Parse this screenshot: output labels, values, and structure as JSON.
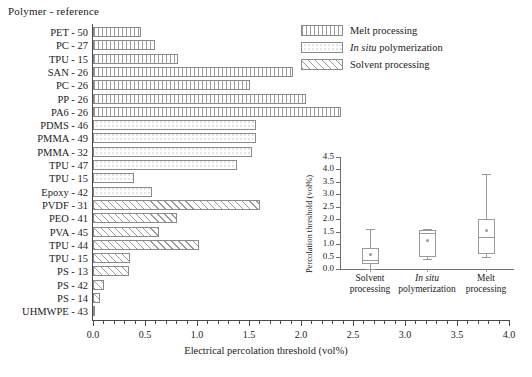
{
  "header": {
    "category_axis_title": "Polymer - reference"
  },
  "legend": {
    "position": "top-right",
    "items": [
      {
        "label": "Melt processing",
        "fill": "vertical-lines",
        "key": "melt"
      },
      {
        "label_italic": "In situ",
        "label_rest": " polymerization",
        "fill": "dotted",
        "key": "insitu"
      },
      {
        "label": "Solvent processing",
        "fill": "diagonal-hatch",
        "key": "solvent"
      }
    ]
  },
  "chart_data": {
    "type": "bar",
    "orientation": "horizontal",
    "title": "",
    "xlabel": "Electrical percolation threshold (vol%)",
    "ylabel": "Polymer - reference",
    "xlim": [
      0.0,
      4.0
    ],
    "xticks": [
      0.0,
      0.5,
      1.0,
      1.5,
      2.0,
      2.5,
      3.0,
      3.5,
      4.0
    ],
    "xticklabels": [
      "0.0",
      "0.5",
      "1.0",
      "1.5",
      "2.0",
      "2.5",
      "3.0",
      "3.5",
      "4.0"
    ],
    "grid": false,
    "categories": [
      "PET - 50",
      "PC - 27",
      "TPU - 15",
      "SAN - 26",
      "PC - 26",
      "PP - 26",
      "PA6 - 26",
      "PDMS - 46",
      "PMMA - 49",
      "PMMA - 32",
      "TPU - 47",
      "TPU - 15",
      "Epoxy - 42",
      "PVDF - 31",
      "PEO - 41",
      "PVA - 45",
      "TPU - 44",
      "TPU - 15",
      "PS - 13",
      "PS - 42",
      "PS - 14",
      "UHMWPE - 43"
    ],
    "values": [
      0.46,
      0.6,
      0.82,
      1.92,
      1.51,
      2.05,
      2.38,
      1.57,
      1.57,
      1.53,
      1.38,
      0.39,
      0.57,
      1.61,
      0.81,
      0.63,
      1.02,
      0.36,
      0.35,
      0.11,
      0.07,
      0.02
    ],
    "groups": [
      "melt",
      "melt",
      "melt",
      "melt",
      "melt",
      "melt",
      "melt",
      "insitu",
      "insitu",
      "insitu",
      "insitu",
      "insitu",
      "insitu",
      "solvent",
      "solvent",
      "solvent",
      "solvent",
      "solvent",
      "solvent",
      "solvent",
      "solvent",
      "solvent"
    ]
  },
  "inset_chart": {
    "type": "box",
    "title": "",
    "ylabel": "Percolation threshold (vol%)",
    "xlabel": "",
    "ylim": [
      0.0,
      4.5
    ],
    "yticks": [
      0.0,
      0.5,
      1.0,
      1.5,
      2.0,
      2.5,
      3.0,
      3.5,
      4.0,
      4.5
    ],
    "yticklabels": [
      "0.0",
      "0.5",
      "1.0",
      "1.5",
      "2.0",
      "2.5",
      "3.0",
      "3.5",
      "4.0",
      "4.5"
    ],
    "grid": false,
    "boxes": [
      {
        "label_line1": "Solvent",
        "label_line2": "processing",
        "italic_line1": false,
        "whisker_low": 0.0,
        "q1": 0.2,
        "median": 0.35,
        "q3": 0.85,
        "whisker_high": 1.6,
        "mean": 0.6
      },
      {
        "label_line1": "In situ",
        "label_line2": "polymerization",
        "italic_line1": true,
        "whisker_low": 0.4,
        "q1": 0.5,
        "median": 1.45,
        "q3": 1.55,
        "whisker_high": 1.6,
        "mean": 1.15
      },
      {
        "label_line1": "Melt",
        "label_line2": "processing",
        "italic_line1": false,
        "whisker_low": 0.5,
        "q1": 0.6,
        "median": 1.3,
        "q3": 2.0,
        "whisker_high": 3.8,
        "mean": 1.55
      }
    ]
  },
  "colors": {
    "axis": "#4a4a4a",
    "bar_border": "#8a8a8a",
    "hatch": "#9a9a9a",
    "text": "#1b1b1b",
    "background": "#ffffff"
  }
}
